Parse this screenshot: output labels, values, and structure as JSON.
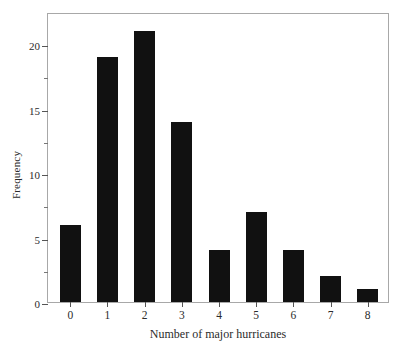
{
  "chart_data": {
    "type": "bar",
    "title": "",
    "xlabel": "Number of major hurricanes",
    "ylabel": "Frequency",
    "categories": [
      "0",
      "1",
      "2",
      "3",
      "4",
      "5",
      "6",
      "7",
      "8"
    ],
    "values": [
      6,
      19,
      21,
      14,
      4,
      7,
      4,
      2,
      1
    ],
    "series": [
      {
        "name": "Frequency",
        "values": [
          6,
          19,
          21,
          14,
          4,
          7,
          4,
          2,
          1
        ]
      }
    ],
    "ylim": [
      0,
      22.5
    ],
    "xlim": [
      -0.6,
      8.6
    ],
    "y_major_ticks": [
      0,
      5,
      10,
      15,
      20
    ],
    "y_major_tick_labels": [
      "0",
      "5",
      "10",
      "15",
      "20"
    ],
    "y_minor_ticks": [
      2.5,
      7.5,
      12.5,
      17.5
    ],
    "x_tick_labels": [
      "0",
      "1",
      "2",
      "3",
      "4",
      "5",
      "6",
      "7",
      "8"
    ],
    "grid": false,
    "legend": false,
    "legend_position": "none",
    "bar_color": "#111111",
    "frame_color": "#a8a8a8",
    "background_color": "#ffffff",
    "text_color": "#2b2b2b",
    "annotations": []
  }
}
